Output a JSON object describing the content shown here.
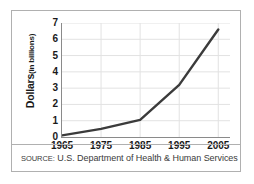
{
  "figure": {
    "source_prefix": "SOURCE:",
    "source_body": "U.S. Department of Health & Human Services"
  },
  "chart_data": {
    "type": "line",
    "title": "",
    "xlabel": "",
    "ylabel": "Dollars (in billions)",
    "ylabel_main": "Dollars",
    "ylabel_sub": "(in billions)",
    "x": [
      1965,
      1975,
      1985,
      1995,
      2005
    ],
    "values": [
      0.1,
      0.5,
      1.05,
      3.2,
      6.6
    ],
    "xticklabels": [
      "1965",
      "1975",
      "1985",
      "1995",
      "2005"
    ],
    "yticklabels": [
      "0",
      "1",
      "2",
      "3",
      "4",
      "5",
      "6",
      "7"
    ],
    "yticks": [
      0,
      1,
      2,
      3,
      4,
      5,
      6,
      7
    ],
    "xlim": [
      1965,
      2008
    ],
    "ylim": [
      0,
      7
    ],
    "grid": true,
    "grid_color": "#e2e2e2",
    "line_color": "#3b3b3b",
    "line_width": 2.4,
    "legend": "none",
    "source": "SOURCE: U.S. Department of Health & Human Services"
  }
}
